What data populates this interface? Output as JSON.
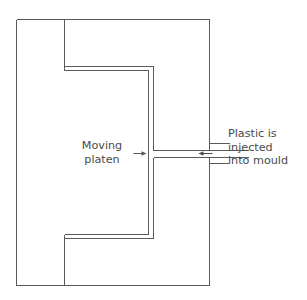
{
  "diagram": {
    "background_color": "#ffffff",
    "line_color": "#5a5a5a",
    "text_color": "#4a4a4a",
    "labels": {
      "moving_platen": {
        "name": "Moving platen",
        "line1": "Moving",
        "line2": "platen"
      },
      "plastic_injected": {
        "name": "Plastic is injected into mould",
        "line1": "Plastic is",
        "line2": "injected",
        "line3": "into mould"
      }
    },
    "annotations": {
      "moving_platen_arrow_direction": "right",
      "injection_arrow_direction": "left"
    },
    "geometry": {
      "outer_frame": {
        "x": 16,
        "y": 19,
        "width": 193,
        "height": 266
      },
      "platen_step_top_y": 66,
      "platen_step_bottom_y": 238,
      "platen_left_x": 64,
      "platen_channel_x": [
        148,
        153
      ],
      "nozzle_channel_y": [
        150,
        157
      ],
      "nozzle_right_x": 248
    }
  }
}
